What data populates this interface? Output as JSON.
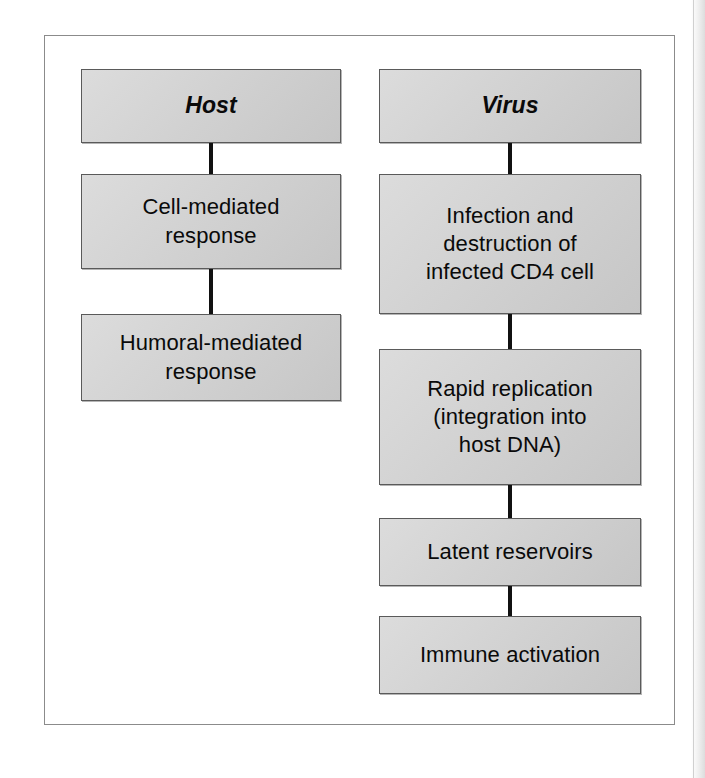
{
  "figure": {
    "frame_border_color": "#8b8b8b",
    "box_fill_color": "#d2d2d2",
    "box_border_color": "#5a5a5a",
    "connector_color": "#111111",
    "background_color": "#ffffff"
  },
  "columns": [
    {
      "id": "host",
      "header": "Host",
      "nodes": [
        {
          "id": "host-header",
          "label": "Host",
          "style": "header"
        },
        {
          "id": "cell-mediated-response",
          "label": "Cell-mediated\nresponse",
          "style": "body"
        },
        {
          "id": "humoral-mediated-response",
          "label": "Humoral-mediated\nresponse",
          "style": "body"
        }
      ],
      "connectors": [
        {
          "from": "host-header",
          "to": "cell-mediated-response"
        },
        {
          "from": "cell-mediated-response",
          "to": "humoral-mediated-response"
        }
      ]
    },
    {
      "id": "virus",
      "header": "Virus",
      "nodes": [
        {
          "id": "virus-header",
          "label": "Virus",
          "style": "header"
        },
        {
          "id": "infection-destruction-cd4",
          "label": "Infection and\ndestruction of\ninfected CD4 cell",
          "style": "body"
        },
        {
          "id": "rapid-replication",
          "label": "Rapid replication\n(integration into\nhost DNA)",
          "style": "body"
        },
        {
          "id": "latent-reservoirs",
          "label": "Latent reservoirs",
          "style": "body"
        },
        {
          "id": "immune-activation",
          "label": "Immune activation",
          "style": "body"
        }
      ],
      "connectors": [
        {
          "from": "virus-header",
          "to": "infection-destruction-cd4"
        },
        {
          "from": "infection-destruction-cd4",
          "to": "rapid-replication"
        },
        {
          "from": "rapid-replication",
          "to": "latent-reservoirs"
        },
        {
          "from": "latent-reservoirs",
          "to": "immune-activation"
        }
      ]
    }
  ]
}
